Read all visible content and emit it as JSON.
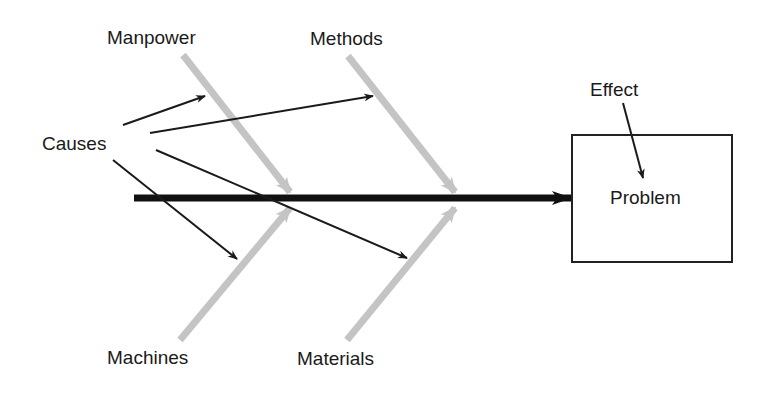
{
  "diagram": {
    "type": "fishbone / cause-and-effect (Ishikawa)",
    "labels": {
      "causes": "Causes",
      "effect": "Effect",
      "problem": "Problem",
      "categories": {
        "manpower": "Manpower",
        "methods": "Methods",
        "machines": "Machines",
        "materials": "Materials"
      }
    },
    "colors": {
      "spine": "#111111",
      "bones": "#c4c4c4",
      "arrows": "#1a1a1a",
      "box_border": "#222222",
      "background": "#ffffff"
    }
  }
}
